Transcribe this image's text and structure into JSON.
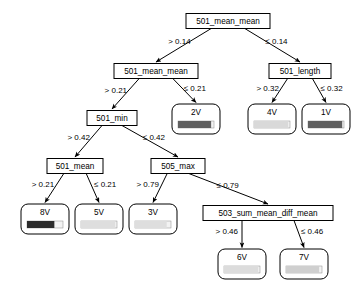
{
  "figure": {
    "background_color": "#ffffff",
    "line_color": "#000000",
    "width": 358,
    "height": 296
  },
  "chart_data": {
    "type": "diagram",
    "diagram_type": "decision-tree",
    "title": "",
    "operators": {
      "greater": "> ",
      "less_equal": "≤ "
    },
    "nodes": [
      {
        "id": "n0",
        "kind": "split",
        "label": "501_mean_mean",
        "x": 228,
        "y": 21,
        "w": 84,
        "h": 15,
        "left_edge": "> 0.14",
        "right_edge": "≤ 0.14",
        "left_child": "n1",
        "right_child": "n2"
      },
      {
        "id": "n1",
        "kind": "split",
        "label": "501_mean_mean",
        "x": 156,
        "y": 71,
        "w": 84,
        "h": 15,
        "left_edge": "> 0.21",
        "right_edge": "≤ 0.21",
        "left_child": "n3",
        "right_child": "L2V"
      },
      {
        "id": "n2",
        "kind": "split",
        "label": "501_length",
        "x": 300,
        "y": 71,
        "w": 62,
        "h": 15,
        "left_edge": "> 0.32",
        "right_edge": "≤ 0.32",
        "left_child": "L4V",
        "right_child": "L1V"
      },
      {
        "id": "n3",
        "kind": "split",
        "label": "501_min",
        "x": 112,
        "y": 118,
        "w": 50,
        "h": 15,
        "left_edge": "> 0.42",
        "right_edge": "≤ 0.42",
        "left_child": "n4",
        "right_child": "n5"
      },
      {
        "id": "n4",
        "kind": "split",
        "label": "501_mean",
        "x": 75,
        "y": 166,
        "w": 56,
        "h": 15,
        "left_edge": "> 0.21",
        "right_edge": "≤ 0.21",
        "left_child": "L8V",
        "right_child": "L5V"
      },
      {
        "id": "n5",
        "kind": "split",
        "label": "505_max",
        "x": 178,
        "y": 166,
        "w": 54,
        "h": 15,
        "left_edge": "> 0.79",
        "right_edge": "≤ 0.79",
        "left_child": "L3V",
        "right_child": "n6"
      },
      {
        "id": "n6",
        "kind": "split",
        "label": "503_sum_mean_diff_mean",
        "x": 268,
        "y": 213,
        "w": 130,
        "h": 15,
        "left_edge": "> 0.46",
        "right_edge": "≤ 0.46",
        "left_child": "L6V",
        "right_child": "L7V"
      },
      {
        "id": "L2V",
        "kind": "leaf",
        "label": "2V",
        "x": 196,
        "y": 119,
        "w": 48,
        "h": 30,
        "bar_fill_ratio": 0.92,
        "bar_color": "#5f5f5f"
      },
      {
        "id": "L4V",
        "kind": "leaf",
        "label": "4V",
        "x": 272,
        "y": 119,
        "w": 48,
        "h": 30,
        "bar_fill_ratio": 0.95,
        "bar_color": "#d9d9d9"
      },
      {
        "id": "L1V",
        "kind": "leaf",
        "label": "1V",
        "x": 326,
        "y": 119,
        "w": 48,
        "h": 30,
        "bar_fill_ratio": 0.95,
        "bar_color": "#5f5f5f"
      },
      {
        "id": "L8V",
        "kind": "leaf",
        "label": "8V",
        "x": 45,
        "y": 219,
        "w": 48,
        "h": 30,
        "bar_fill_ratio": 0.76,
        "bar_color": "#2b2b2b"
      },
      {
        "id": "L5V",
        "kind": "leaf",
        "label": "5V",
        "x": 99,
        "y": 219,
        "w": 48,
        "h": 30,
        "bar_fill_ratio": 0.95,
        "bar_color": "#dedede"
      },
      {
        "id": "L3V",
        "kind": "leaf",
        "label": "3V",
        "x": 153,
        "y": 219,
        "w": 48,
        "h": 30,
        "bar_fill_ratio": 0.88,
        "bar_color": "#dedede"
      },
      {
        "id": "L6V",
        "kind": "leaf",
        "label": "6V",
        "x": 242,
        "y": 264,
        "w": 48,
        "h": 30,
        "bar_fill_ratio": 0.95,
        "bar_color": "#dcdcdc"
      },
      {
        "id": "L7V",
        "kind": "leaf",
        "label": "7V",
        "x": 304,
        "y": 264,
        "w": 48,
        "h": 30,
        "bar_fill_ratio": 0.92,
        "bar_color": "#cfcfcf"
      }
    ]
  }
}
